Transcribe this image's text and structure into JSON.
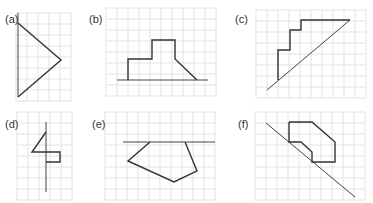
{
  "panels": [
    {
      "id": "a",
      "label": "(a)",
      "label_pos": [
        5,
        13
      ],
      "grid": {
        "x0": 16,
        "y0": 13,
        "cols": 5,
        "rows": 8,
        "cell": 11
      },
      "mirror_line": [
        [
          18,
          13
        ],
        [
          18,
          97
        ]
      ],
      "shape": {
        "points": [
          [
            18,
            23
          ],
          [
            61,
            60
          ],
          [
            18,
            97
          ]
        ],
        "closed": false
      }
    },
    {
      "id": "b",
      "label": "(b)",
      "label_pos": [
        89,
        13
      ],
      "grid": {
        "x0": 106,
        "y0": 8,
        "cols": 10,
        "rows": 8,
        "cell": 11
      },
      "mirror_line": [
        [
          117,
          80
        ],
        [
          208,
          80
        ]
      ],
      "shape": {
        "points": [
          [
            128,
            80
          ],
          [
            128,
            59
          ],
          [
            152,
            59
          ],
          [
            152,
            40
          ],
          [
            175,
            40
          ],
          [
            175,
            59
          ],
          [
            197,
            80
          ]
        ],
        "closed": false
      }
    },
    {
      "id": "c",
      "label": "(c)",
      "label_pos": [
        235,
        13
      ],
      "grid": {
        "x0": 256,
        "y0": 10,
        "cols": 10,
        "rows": 8,
        "cell": 11
      },
      "mirror_line": [
        [
          267,
          90
        ],
        [
          350,
          20
        ]
      ],
      "shape": {
        "points": [
          [
            278,
            80
          ],
          [
            278,
            50
          ],
          [
            290,
            50
          ],
          [
            290,
            30
          ],
          [
            301,
            30
          ],
          [
            301,
            20
          ],
          [
            350,
            20
          ]
        ],
        "closed": false
      }
    },
    {
      "id": "d",
      "label": "(d)",
      "label_pos": [
        5,
        118
      ],
      "grid": {
        "x0": 17,
        "y0": 112,
        "cols": 5,
        "rows": 8,
        "cell": 11
      },
      "mirror_line": [
        [
          46,
          122
        ],
        [
          46,
          192
        ]
      ],
      "shape": {
        "points": [
          [
            46,
            132
          ],
          [
            32,
            152
          ],
          [
            60,
            152
          ],
          [
            60,
            162
          ],
          [
            46,
            162
          ]
        ],
        "closed": false
      }
    },
    {
      "id": "e",
      "label": "(e)",
      "label_pos": [
        92,
        118
      ],
      "grid": {
        "x0": 105,
        "y0": 112,
        "cols": 10,
        "rows": 8,
        "cell": 11
      },
      "mirror_line": [
        [
          123,
          142
        ],
        [
          215,
          142
        ]
      ],
      "shape": {
        "points": [
          [
            150,
            142
          ],
          [
            128,
            161
          ],
          [
            174,
            182
          ],
          [
            197,
            171
          ],
          [
            185,
            142
          ]
        ],
        "closed": false
      }
    },
    {
      "id": "f",
      "label": "(f)",
      "label_pos": [
        238,
        118
      ],
      "grid": {
        "x0": 255,
        "y0": 112,
        "cols": 10,
        "rows": 8,
        "cell": 11
      },
      "mirror_line": [
        [
          266,
          123
        ],
        [
          355,
          197
        ]
      ],
      "shape": {
        "points": [
          [
            289,
            122
          ],
          [
            312,
            122
          ],
          [
            335,
            142
          ],
          [
            335,
            162
          ],
          [
            312,
            162
          ],
          [
            312,
            152
          ],
          [
            301,
            142
          ],
          [
            289,
            142
          ],
          [
            289,
            122
          ]
        ],
        "closed": false
      }
    }
  ],
  "colors": {
    "grid": "#dcdcdc",
    "shape": "#333333",
    "mirror": "#444444",
    "label": "#333333"
  }
}
